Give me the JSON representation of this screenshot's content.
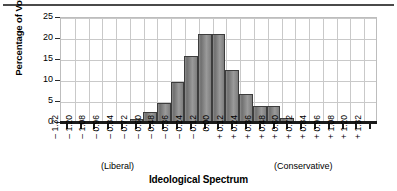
{
  "figure": {
    "has_top_rule": true,
    "background": "#ffffff",
    "bar_color": "#808080",
    "bar_edge_color": "#3d3d3d",
    "grid_color": "#c9c9c9",
    "axis_color": "#1a1a1a"
  },
  "annotations": {
    "liberal": "(Liberal)",
    "conservative": "(Conservative)"
  },
  "chart_data": {
    "type": "bar",
    "title": "",
    "xlabel": "Ideological Spectrum",
    "ylabel": "Percentage of Voters",
    "ylim": [
      0,
      25
    ],
    "yticks": [
      0,
      5,
      10,
      15,
      20,
      25
    ],
    "ytick_labels": [
      "0",
      "5",
      "10",
      "15",
      "20",
      "25"
    ],
    "grid": true,
    "legend": "none",
    "categories": [
      "– 1.32",
      "– 1.20",
      "– 1.08",
      "– 0.96",
      "– 0.84",
      "– 0.72",
      "– 0.60",
      "– 0.48",
      "– 0.36",
      "– 0.24",
      "– 0.12",
      "0.00",
      "+ 0.12",
      "+ 0.24",
      "+ 0.36",
      "+ 0.48",
      "+ 0.60",
      "+ 0.72",
      "+ 0.84",
      "+ 0.96",
      "+ 1.08",
      "+ 1.20",
      "+ 1.32"
    ],
    "values": [
      0.1,
      0.1,
      0.1,
      0.1,
      0.1,
      0.7,
      2.5,
      4.5,
      9.5,
      15.7,
      21.0,
      21.0,
      12.3,
      6.6,
      3.9,
      3.8,
      1.0,
      0.2,
      0.1,
      0.1,
      0.1,
      0.1,
      0.1
    ]
  }
}
